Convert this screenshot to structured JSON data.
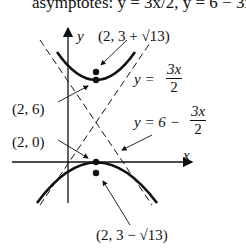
{
  "header_text": "asymptotes: y = 3x/2, y = 6 − 3x/2",
  "axes": {
    "x_label": "x",
    "y_label": "y"
  },
  "points": [
    {
      "label": "(2, 3 + √13)",
      "role": "focus-upper"
    },
    {
      "label": "(2, 6)",
      "role": "vertex-upper"
    },
    {
      "label": "(2, 0)",
      "role": "vertex-lower"
    },
    {
      "label": "(2, 3 − √13)",
      "role": "focus-lower"
    }
  ],
  "asymptotes": [
    {
      "lhs": "y =",
      "numerator": "3x",
      "denominator": "2"
    },
    {
      "lhs": "y = 6 −",
      "numerator": "3x",
      "denominator": "2"
    }
  ]
}
